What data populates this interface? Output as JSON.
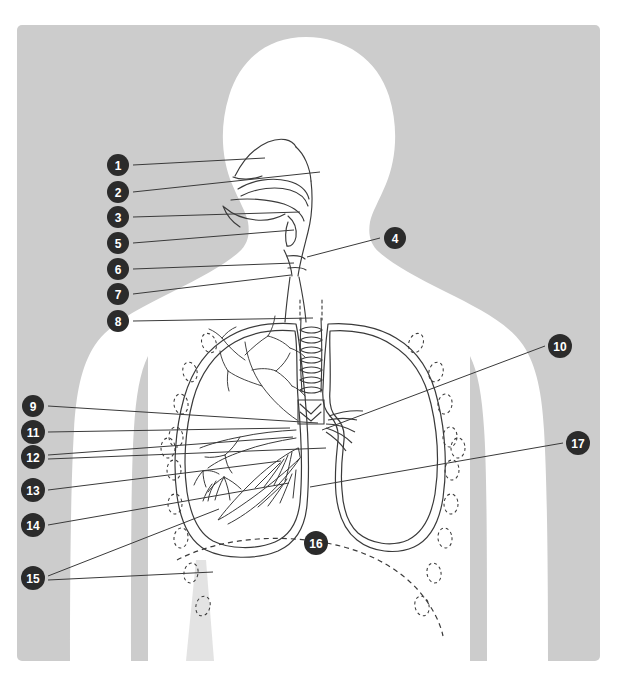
{
  "figure": {
    "type": "anatomical-line-diagram",
    "panel_background_color": "#cccccc",
    "body_silhouette_color": "#ffffff",
    "line_color": "#3a3a3a",
    "label_badge_fill": "#2b2b2b",
    "label_badge_text_color": "#ffffff",
    "page_background_color": "#ffffff"
  },
  "labels": [
    {
      "id": "1",
      "text": "1",
      "cx": 118,
      "cy": 165,
      "side": "left",
      "leader": [
        [
          133,
          165
        ],
        [
          265,
          158
        ]
      ]
    },
    {
      "id": "2",
      "text": "2",
      "cx": 118,
      "cy": 192,
      "side": "left",
      "leader": [
        [
          133,
          192
        ],
        [
          320,
          172
        ]
      ]
    },
    {
      "id": "3",
      "text": "3",
      "cx": 118,
      "cy": 217,
      "side": "left",
      "leader": [
        [
          133,
          217
        ],
        [
          300,
          212
        ]
      ]
    },
    {
      "id": "5",
      "text": "5",
      "cx": 118,
      "cy": 243,
      "side": "left",
      "leader": [
        [
          133,
          243
        ],
        [
          294,
          230
        ]
      ]
    },
    {
      "id": "6",
      "text": "6",
      "cx": 118,
      "cy": 269,
      "side": "left",
      "leader": [
        [
          133,
          269
        ],
        [
          294,
          263
        ]
      ]
    },
    {
      "id": "7",
      "text": "7",
      "cx": 118,
      "cy": 294,
      "side": "left",
      "leader": [
        [
          133,
          294
        ],
        [
          291,
          275
        ]
      ]
    },
    {
      "id": "8",
      "text": "8",
      "cx": 118,
      "cy": 321,
      "side": "left",
      "leader": [
        [
          133,
          321
        ],
        [
          313,
          318
        ]
      ]
    },
    {
      "id": "4",
      "text": "4",
      "cx": 395,
      "cy": 238,
      "side": "right",
      "leader": [
        [
          380,
          238
        ],
        [
          307,
          257
        ]
      ]
    },
    {
      "id": "9",
      "text": "9",
      "cx": 33,
      "cy": 406,
      "side": "left",
      "leader": [
        [
          48,
          406
        ],
        [
          318,
          423
        ]
      ]
    },
    {
      "id": "10",
      "text": "10",
      "cx": 560,
      "cy": 346,
      "side": "right",
      "leader": [
        [
          545,
          346
        ],
        [
          322,
          430
        ]
      ]
    },
    {
      "id": "11",
      "text": "11",
      "cx": 33,
      "cy": 432,
      "side": "left",
      "leader": [
        [
          48,
          432
        ],
        [
          290,
          428
        ]
      ]
    },
    {
      "id": "12",
      "text": "12",
      "cx": 33,
      "cy": 457,
      "side": "left",
      "leader": [
        [
          48,
          455
        ],
        [
          293,
          437
        ]
      ]
    },
    {
      "id": "12b",
      "text": "",
      "cx": null,
      "cy": null,
      "side": "left",
      "leader": [
        [
          48,
          459
        ],
        [
          326,
          448
        ]
      ]
    },
    {
      "id": "13",
      "text": "13",
      "cx": 33,
      "cy": 490,
      "side": "left",
      "leader": [
        [
          48,
          490
        ],
        [
          281,
          461
        ]
      ]
    },
    {
      "id": "14",
      "text": "14",
      "cx": 33,
      "cy": 525,
      "side": "left",
      "leader": [
        [
          48,
          525
        ],
        [
          289,
          483
        ]
      ]
    },
    {
      "id": "15",
      "text": "15",
      "cx": 33,
      "cy": 578,
      "side": "left",
      "leader": [
        [
          48,
          576
        ],
        [
          219,
          509
        ]
      ]
    },
    {
      "id": "15b",
      "text": "",
      "cx": null,
      "cy": null,
      "side": "left",
      "leader": [
        [
          48,
          580
        ],
        [
          213,
          572
        ]
      ]
    },
    {
      "id": "17",
      "text": "17",
      "cx": 578,
      "cy": 443,
      "side": "right",
      "leader": [
        [
          563,
          443
        ],
        [
          310,
          487
        ]
      ]
    },
    {
      "id": "16",
      "text": "16",
      "cx": 316,
      "cy": 543,
      "side": "bottom",
      "leader": []
    }
  ],
  "label_count": 17,
  "structures": {
    "ribs_note": "pairs of dashed oval rib cross-sections flank both lungs",
    "diaphragm_note": "dashed dome line beneath the lungs, marked 16",
    "trachea_note": "ringed tube descending from larynx to carina",
    "left_lung_note": "bronchial tree and vascular detail drawn inside viewer-left lung",
    "right_lung_note": "viewer-right lung drawn as empty outline with cardiac notch"
  }
}
